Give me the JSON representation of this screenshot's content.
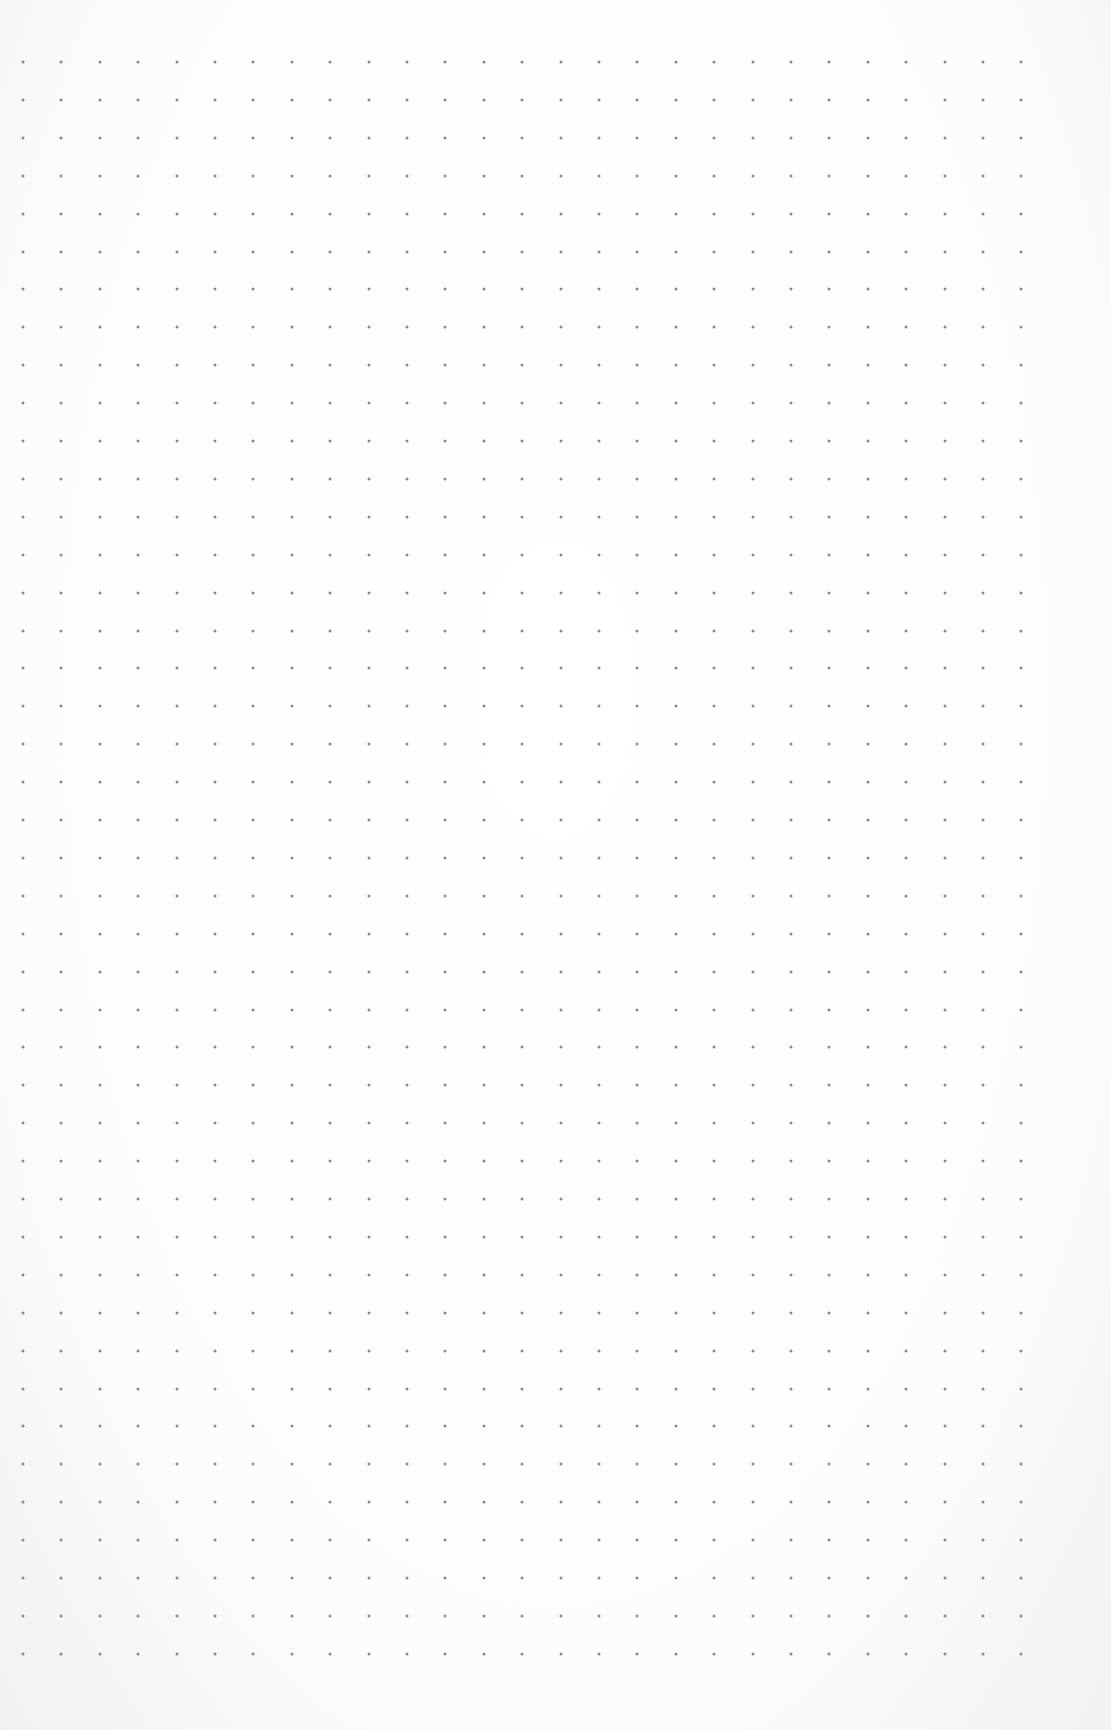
{
  "sheet": {
    "type": "dot-grid paper",
    "background_color": "#fbfbfa",
    "dot_color": "#8a8a8a"
  },
  "grid": {
    "columns": 27,
    "rows": 43,
    "first_x": 23,
    "first_y": 62,
    "step_x": 38.4,
    "step_y": 37.9,
    "dot_size": 3
  }
}
